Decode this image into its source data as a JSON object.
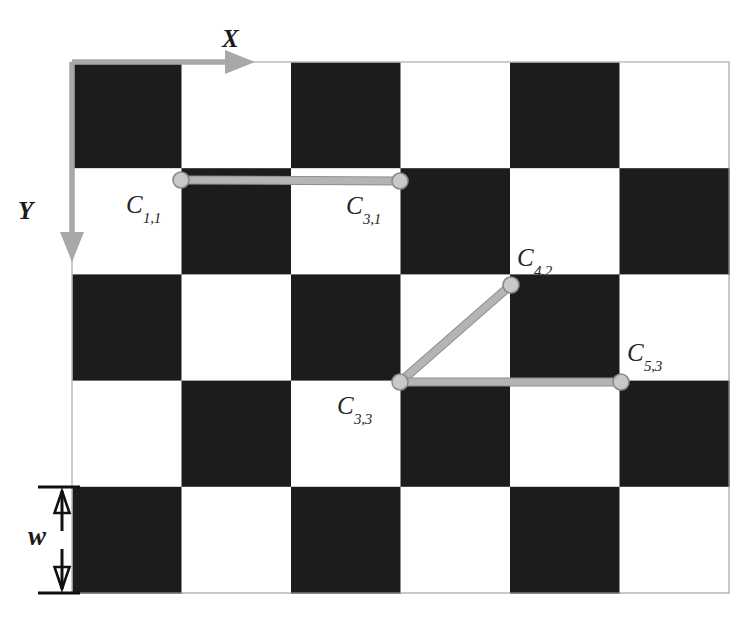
{
  "figure": {
    "type": "checkerboard-calibration-diagram",
    "background_color": "#ffffff",
    "board": {
      "x": 72,
      "y": 62,
      "width": 657,
      "height": 531,
      "columns": 6,
      "rows": 5,
      "square_width": 109.5,
      "square_height": 106.2,
      "dark_color": "#1c1c1c",
      "light_color": "#ffffff",
      "border_color": "#9a9aa5",
      "pattern": [
        [
          "dark",
          "light",
          "dark",
          "light",
          "dark",
          "light"
        ],
        [
          "light",
          "dark",
          "light",
          "dark",
          "light",
          "dark"
        ],
        [
          "dark",
          "light",
          "dark",
          "light",
          "dark",
          "light"
        ],
        [
          "light",
          "dark",
          "light",
          "dark",
          "light",
          "dark"
        ],
        [
          "dark",
          "light",
          "dark",
          "light",
          "dark",
          "light"
        ]
      ]
    },
    "axes": {
      "color": "#a8a8a8",
      "origin": {
        "x": 72,
        "y": 62
      },
      "x_axis": {
        "label": "X",
        "label_x": 222,
        "label_y": 26,
        "from_x": 72,
        "from_y": 62,
        "to_x": 255,
        "to_y": 62
      },
      "y_axis": {
        "label": "Y",
        "label_x": 18,
        "label_y": 198,
        "from_x": 72,
        "from_y": 62,
        "to_x": 72,
        "to_y": 262
      }
    },
    "dimension": {
      "label": "w",
      "label_x": 28,
      "label_y": 523,
      "color": "#111111",
      "line_x": 62,
      "top_y": 487,
      "bottom_y": 593,
      "tick_left": 38,
      "tick_right": 80
    },
    "corners": [
      {
        "id": "C_1_1",
        "base": "C",
        "sub": "1,1",
        "x": 181,
        "y": 180,
        "label_x": 126,
        "label_y": 192
      },
      {
        "id": "C_3_1",
        "base": "C",
        "sub": "3,1",
        "x": 400,
        "y": 181,
        "label_x": 346,
        "label_y": 193
      },
      {
        "id": "C_4_2",
        "base": "C",
        "sub": "4,2",
        "x": 511,
        "y": 285,
        "label_x": 517,
        "label_y": 245
      },
      {
        "id": "C_3_3",
        "base": "C",
        "sub": "3,3",
        "x": 400,
        "y": 382,
        "label_x": 337,
        "label_y": 393
      },
      {
        "id": "C_5_3",
        "base": "C",
        "sub": "5,3",
        "x": 621,
        "y": 382,
        "label_x": 627,
        "label_y": 340
      }
    ],
    "connections": {
      "line_color": "#b4b4b4",
      "line_edge_color": "#8e8e8e",
      "marker_fill": "#c9c9c9",
      "marker_edge": "#8a8a8a",
      "marker_radius": 8,
      "line_width": 7,
      "segments": [
        {
          "from": "C_1_1",
          "to": "C_3_1"
        },
        {
          "from": "C_3_3",
          "to": "C_4_2"
        },
        {
          "from": "C_3_3",
          "to": "C_5_3"
        }
      ]
    }
  }
}
